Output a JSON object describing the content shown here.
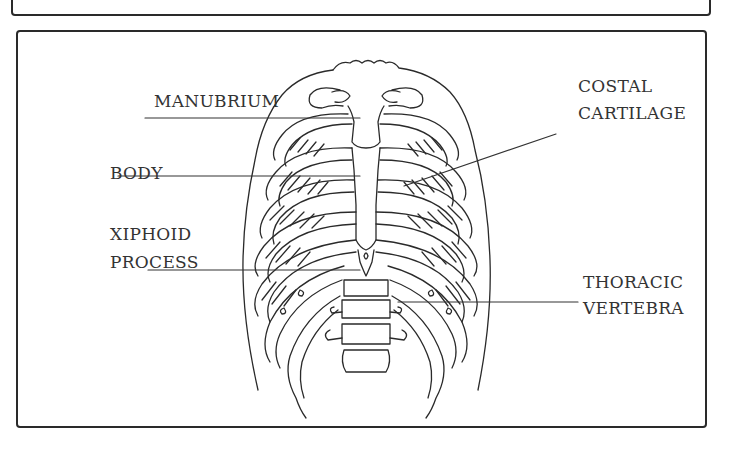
{
  "figure": {
    "labels": {
      "manubrium": "MANUBRIUM",
      "body": "BODY",
      "xiphoid_line1": "XIPHOID",
      "xiphoid_line2": "PROCESS",
      "costal_line1": "COSTAL",
      "costal_line2": "CARTILAGE",
      "thoracic_line1": "THORACIC",
      "thoracic_line2": "VERTEBRA"
    },
    "colors": {
      "stroke": "#2a2a2a",
      "background": "#ffffff"
    }
  }
}
